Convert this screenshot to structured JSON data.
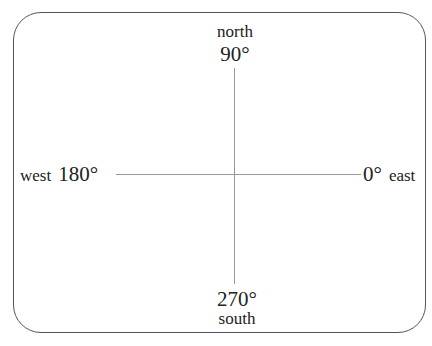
{
  "diagram": {
    "type": "angle-direction-compass",
    "axes": {
      "north": {
        "word": "north",
        "angle": "90°"
      },
      "south": {
        "word": "south",
        "angle": "270°"
      },
      "west": {
        "word": "west",
        "angle": "180°"
      },
      "east": {
        "word": "east",
        "angle": "0°"
      }
    },
    "colors": {
      "frame": "#555555",
      "axis_lines": "#999999",
      "text": "#222222"
    }
  }
}
